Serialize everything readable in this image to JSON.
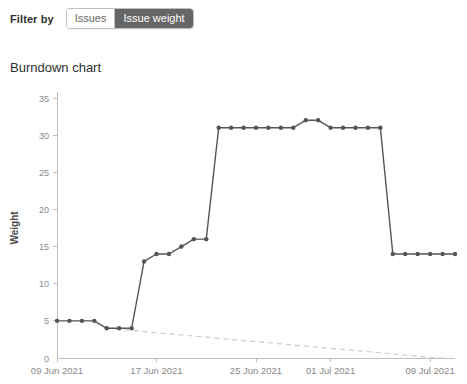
{
  "filter": {
    "label": "Filter by",
    "options": [
      {
        "label": "Issues",
        "selected": false
      },
      {
        "label": "Issue weight",
        "selected": true
      }
    ]
  },
  "chart_title": "Burndown chart",
  "colors": {
    "series": "#555555",
    "guide": "#cccccc",
    "axis": "#bfbfbf",
    "tick_text": "#888888",
    "toggle_active_bg": "#666666",
    "toggle_active_text": "#ffffff",
    "toggle_inactive_text": "#666666"
  },
  "chart_data": {
    "type": "line",
    "title": "Burndown chart",
    "xlabel": "",
    "ylabel": "Weight",
    "ylim": [
      0,
      35
    ],
    "yticks": [
      0,
      5,
      10,
      15,
      20,
      25,
      30,
      35
    ],
    "xticks": [
      "09 Jun 2021",
      "17 Jun 2021",
      "25 Jun 2021",
      "01 Jul 2021",
      "09 Jul 2021"
    ],
    "xtick_indices": [
      0,
      8,
      16,
      22,
      30
    ],
    "grid": false,
    "legend": "none",
    "x": [
      "09 Jun 2021",
      "10 Jun 2021",
      "11 Jun 2021",
      "12 Jun 2021",
      "13 Jun 2021",
      "14 Jun 2021",
      "15 Jun 2021",
      "16 Jun 2021",
      "17 Jun 2021",
      "18 Jun 2021",
      "19 Jun 2021",
      "20 Jun 2021",
      "21 Jun 2021",
      "22 Jun 2021",
      "23 Jun 2021",
      "24 Jun 2021",
      "25 Jun 2021",
      "26 Jun 2021",
      "27 Jun 2021",
      "28 Jun 2021",
      "29 Jun 2021",
      "30 Jun 2021",
      "01 Jul 2021",
      "02 Jul 2021",
      "03 Jul 2021",
      "04 Jul 2021",
      "05 Jul 2021",
      "06 Jul 2021",
      "07 Jul 2021",
      "08 Jul 2021",
      "09 Jul 2021",
      "10 Jul 2021",
      "11 Jul 2021"
    ],
    "series": [
      {
        "name": "Remaining weight",
        "style": "solid-with-markers",
        "values": [
          5,
          5,
          5,
          5,
          4,
          4,
          4,
          13,
          14,
          14,
          15,
          16,
          16,
          31,
          31,
          31,
          31,
          31,
          31,
          31,
          32,
          32,
          31,
          31,
          31,
          31,
          31,
          14,
          14,
          14,
          14,
          14,
          14
        ]
      },
      {
        "name": "Ideal burndown guideline",
        "style": "dashed",
        "values": [
          null,
          null,
          null,
          null,
          4.0,
          3.85,
          3.7,
          3.55,
          3.4,
          3.25,
          3.1,
          2.95,
          2.8,
          2.65,
          2.5,
          2.35,
          2.2,
          2.05,
          1.9,
          1.75,
          1.6,
          1.45,
          1.3,
          1.15,
          1.0,
          0.85,
          0.7,
          0.55,
          0.4,
          0.25,
          0.1,
          0.0,
          null
        ]
      }
    ]
  }
}
